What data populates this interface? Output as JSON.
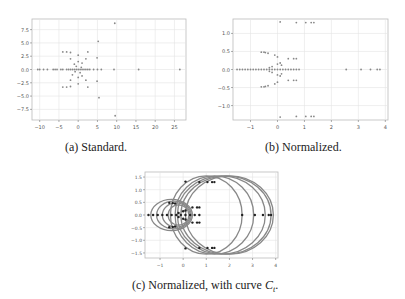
{
  "figure": {
    "subfigures": [
      {
        "id": "a",
        "caption": "(a)  Standard."
      },
      {
        "id": "b",
        "caption": "(b)  Normalized."
      },
      {
        "id": "c",
        "caption_prefix": "(c)  Normalized, with curve ",
        "caption_var": "C",
        "caption_sub": "t",
        "caption_suffix": "."
      }
    ]
  },
  "chart_data": [
    {
      "type": "scatter",
      "title": "(a) Standard.",
      "xlabel": "",
      "ylabel": "",
      "xlim": [
        -12,
        28
      ],
      "ylim": [
        -9.5,
        9.5
      ],
      "xticks": [
        -10,
        -5,
        0,
        5,
        10,
        15,
        20,
        25
      ],
      "yticks": [
        -7.5,
        -5.0,
        -2.5,
        0.0,
        2.5,
        5.0,
        7.5
      ],
      "grid": true,
      "points": [
        [
          -10.5,
          0
        ],
        [
          -10,
          0
        ],
        [
          -9,
          0
        ],
        [
          -8,
          0
        ],
        [
          -6.5,
          0
        ],
        [
          -6,
          0
        ],
        [
          -5.5,
          0
        ],
        [
          -4.5,
          0
        ],
        [
          -4,
          0
        ],
        [
          -3,
          0
        ],
        [
          -2.5,
          0
        ],
        [
          -2,
          0
        ],
        [
          -1.5,
          0
        ],
        [
          -1,
          0
        ],
        [
          -0.5,
          0
        ],
        [
          0,
          0
        ],
        [
          0.5,
          0
        ],
        [
          1,
          0
        ],
        [
          1.5,
          0
        ],
        [
          2,
          0
        ],
        [
          2.5,
          0
        ],
        [
          3,
          0
        ],
        [
          4,
          0
        ],
        [
          5,
          0
        ],
        [
          6,
          0
        ],
        [
          9.3,
          0
        ],
        [
          15.7,
          0
        ],
        [
          26.4,
          0
        ],
        [
          9.5,
          8.7
        ],
        [
          9.6,
          -8.7
        ],
        [
          5.2,
          5.3
        ],
        [
          5.4,
          -5.3
        ],
        [
          4.9,
          2.2
        ],
        [
          4.9,
          -2.2
        ],
        [
          -4,
          3.3
        ],
        [
          -3,
          3.3
        ],
        [
          -2,
          3.2
        ],
        [
          2.5,
          3.3
        ],
        [
          -4,
          -3.3
        ],
        [
          -3,
          -3.3
        ],
        [
          -2,
          -3.2
        ],
        [
          2.5,
          -3.3
        ],
        [
          -1,
          1
        ],
        [
          0,
          1.5
        ],
        [
          1,
          1.2
        ],
        [
          -1.5,
          -1
        ],
        [
          0,
          -1.5
        ],
        [
          1,
          -1.2
        ],
        [
          -2,
          2
        ],
        [
          2,
          2
        ],
        [
          -2,
          -2
        ],
        [
          2,
          -2
        ],
        [
          0,
          2.7
        ],
        [
          0,
          -2.7
        ],
        [
          -0.5,
          0.6
        ],
        [
          0.5,
          -0.6
        ],
        [
          -0.8,
          -0.4
        ],
        [
          0.8,
          0.4
        ]
      ]
    },
    {
      "type": "scatter",
      "title": "(b) Normalized.",
      "xlabel": "",
      "ylabel": "",
      "xlim": [
        -1.65,
        4.1
      ],
      "ylim": [
        -1.4,
        1.4
      ],
      "xticks": [
        -1,
        0,
        1,
        2,
        3,
        4
      ],
      "yticks": [
        -1.0,
        -0.5,
        0.0,
        0.5,
        1.0
      ],
      "grid": true,
      "points": [
        [
          -1.5,
          0
        ],
        [
          -1.4,
          0
        ],
        [
          -1.3,
          0
        ],
        [
          -1.2,
          0
        ],
        [
          -1.1,
          0
        ],
        [
          -1.0,
          0
        ],
        [
          -0.9,
          0
        ],
        [
          -0.8,
          0
        ],
        [
          -0.7,
          0
        ],
        [
          -0.6,
          0
        ],
        [
          -0.5,
          0
        ],
        [
          -0.4,
          0
        ],
        [
          -0.3,
          0
        ],
        [
          -0.2,
          0
        ],
        [
          -0.1,
          0
        ],
        [
          0,
          0
        ],
        [
          0.1,
          0
        ],
        [
          0.2,
          0
        ],
        [
          0.3,
          0
        ],
        [
          0.4,
          0
        ],
        [
          0.5,
          0
        ],
        [
          0.6,
          0
        ],
        [
          0.7,
          0
        ],
        [
          0.8,
          0
        ],
        [
          2.55,
          0
        ],
        [
          3.1,
          0
        ],
        [
          3.45,
          0
        ],
        [
          3.7,
          0
        ],
        [
          3.8,
          0
        ],
        [
          0.1,
          1.32
        ],
        [
          0.7,
          1.3
        ],
        [
          1.05,
          1.3
        ],
        [
          1.25,
          1.3
        ],
        [
          1.35,
          1.3
        ],
        [
          0.1,
          -1.32
        ],
        [
          0.7,
          -1.3
        ],
        [
          1.05,
          -1.3
        ],
        [
          1.25,
          -1.3
        ],
        [
          1.35,
          -1.3
        ],
        [
          -0.6,
          0.48
        ],
        [
          -0.5,
          0.48
        ],
        [
          -0.45,
          0.47
        ],
        [
          -0.35,
          0.45
        ],
        [
          -0.6,
          -0.48
        ],
        [
          -0.5,
          -0.48
        ],
        [
          -0.45,
          -0.47
        ],
        [
          -0.35,
          -0.45
        ],
        [
          -0.1,
          0.4
        ],
        [
          0,
          0.35
        ],
        [
          -0.1,
          -0.4
        ],
        [
          0,
          -0.35
        ],
        [
          0.4,
          0.3
        ],
        [
          0.6,
          0.3
        ],
        [
          0.7,
          0.3
        ],
        [
          0.4,
          -0.3
        ],
        [
          0.6,
          -0.3
        ],
        [
          0.7,
          -0.3
        ],
        [
          0,
          0.15
        ],
        [
          0.1,
          0.18
        ],
        [
          0.15,
          0.12
        ],
        [
          0,
          -0.15
        ],
        [
          0.1,
          -0.18
        ],
        [
          0.15,
          -0.12
        ],
        [
          -0.3,
          0.05
        ],
        [
          -0.3,
          -0.05
        ],
        [
          -0.2,
          0.08
        ],
        [
          -0.2,
          -0.08
        ]
      ]
    },
    {
      "type": "scatter",
      "title": "(c) Normalized, with curve C_t.",
      "xlabel": "",
      "ylabel": "",
      "xlim": [
        -1.65,
        4.1
      ],
      "ylim": [
        -1.7,
        1.7
      ],
      "xticks": [
        -1,
        0,
        1,
        2,
        3,
        4
      ],
      "yticks": [
        -1.5,
        -1.0,
        -0.5,
        0.0,
        0.5,
        1.0,
        1.5
      ],
      "grid": true,
      "curves": [
        {
          "cx": 1.0,
          "rx": 1.55,
          "ry": 1.55
        },
        {
          "cx": 1.35,
          "rx": 1.7,
          "ry": 1.55
        },
        {
          "cx": 1.65,
          "rx": 1.9,
          "ry": 1.55
        },
        {
          "cx": 1.85,
          "rx": 1.95,
          "ry": 1.55
        },
        {
          "cx": 2.0,
          "rx": 1.9,
          "ry": 1.55
        },
        {
          "cx": -0.5,
          "rx": 0.9,
          "ry": 0.62
        },
        {
          "cx": -0.4,
          "rx": 0.75,
          "ry": 0.55
        },
        {
          "cx": -0.3,
          "rx": 0.6,
          "ry": 0.48
        },
        {
          "cx": -0.2,
          "rx": 0.45,
          "ry": 0.4
        }
      ],
      "points": [
        [
          -1.5,
          0
        ],
        [
          -1.3,
          0
        ],
        [
          -1.1,
          0
        ],
        [
          -0.9,
          0
        ],
        [
          -0.7,
          0
        ],
        [
          -0.5,
          0
        ],
        [
          -0.3,
          0
        ],
        [
          -0.1,
          0
        ],
        [
          0.1,
          0
        ],
        [
          0.3,
          0
        ],
        [
          0.5,
          0
        ],
        [
          0.7,
          0
        ],
        [
          2.55,
          0
        ],
        [
          3.1,
          0
        ],
        [
          3.45,
          0
        ],
        [
          3.7,
          0
        ],
        [
          3.8,
          0
        ],
        [
          0.1,
          1.32
        ],
        [
          0.7,
          1.3
        ],
        [
          1.05,
          1.3
        ],
        [
          1.25,
          1.3
        ],
        [
          1.35,
          1.3
        ],
        [
          0.1,
          -1.32
        ],
        [
          0.7,
          -1.3
        ],
        [
          1.05,
          -1.3
        ],
        [
          1.25,
          -1.3
        ],
        [
          1.35,
          -1.3
        ],
        [
          -0.6,
          0.48
        ],
        [
          -0.45,
          0.47
        ],
        [
          -0.35,
          0.45
        ],
        [
          -0.6,
          -0.48
        ],
        [
          -0.45,
          -0.47
        ],
        [
          -0.35,
          -0.45
        ],
        [
          0.4,
          0.3
        ],
        [
          0.6,
          0.3
        ],
        [
          0.7,
          0.3
        ],
        [
          0.4,
          -0.3
        ],
        [
          0.6,
          -0.3
        ],
        [
          0.7,
          -0.3
        ],
        [
          0,
          0.15
        ],
        [
          0.1,
          0.18
        ],
        [
          0,
          -0.15
        ],
        [
          0.1,
          -0.18
        ],
        [
          -0.2,
          0.08
        ],
        [
          -0.2,
          -0.08
        ]
      ]
    }
  ]
}
